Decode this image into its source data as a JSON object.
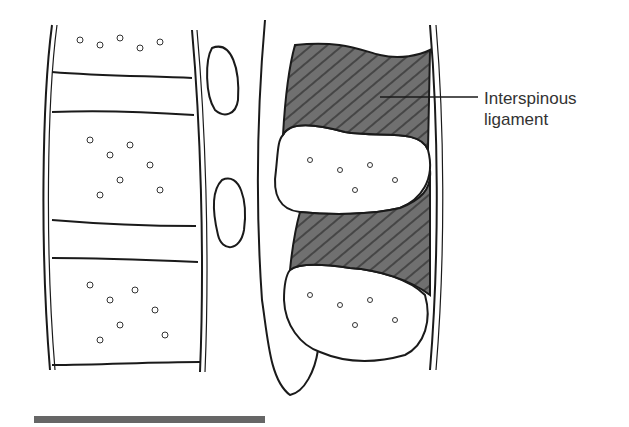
{
  "figure": {
    "labels": [
      {
        "text_line1": "Interspinous",
        "text_line2": "ligament",
        "target": "ligament-between-spinous-processes"
      }
    ]
  },
  "colors": {
    "outline": "#1a1a1a",
    "ligament_fill": "#6e6e6e",
    "bar": "#666666",
    "label_text": "#333333"
  }
}
